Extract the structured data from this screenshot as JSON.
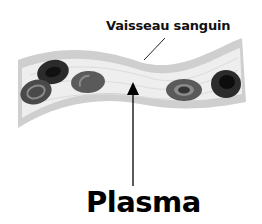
{
  "diagram": {
    "labels": {
      "vessel": "Vaisseau sanguin",
      "plasma": "Plasma"
    },
    "colors": {
      "background": "#ffffff",
      "vessel_wall": "#c8c8c8",
      "vessel_lumen": "#ececec",
      "cell_dark": "#2b2b2b",
      "cell_mid": "#5a5a5a",
      "cell_ring": "#8a8a8a",
      "text": "#000000"
    },
    "cells": [
      {
        "name": "cell-top-left",
        "shade": "dark"
      },
      {
        "name": "cell-bottom-left",
        "shade": "mid"
      },
      {
        "name": "cell-center-left",
        "shade": "mid"
      },
      {
        "name": "cell-center-right",
        "shade": "mid"
      },
      {
        "name": "cell-right",
        "shade": "dark"
      }
    ]
  }
}
